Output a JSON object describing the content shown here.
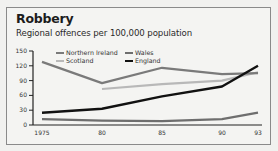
{
  "title": "Robbery",
  "subtitle": "Regional offences per 100,000 population",
  "chart_data": {
    "type": "line",
    "title": "Robbery",
    "subtitle": "Regional offences per 100,000 population",
    "xlabel": "",
    "ylabel": "",
    "x": [
      "1975",
      "80",
      "85",
      "90",
      "93"
    ],
    "x_years": [
      1975,
      1980,
      1985,
      1990,
      1993
    ],
    "yticks": [
      0,
      30,
      60,
      90,
      120,
      150
    ],
    "ylim": [
      0,
      150
    ],
    "grid": false,
    "legend_position": "top inside",
    "series": [
      {
        "name": "Northern Ireland",
        "color": "#7a7a7a",
        "values": [
          128,
          85,
          116,
          103,
          105
        ]
      },
      {
        "name": "Wales",
        "color": "#6e6e6e",
        "values": [
          12,
          9,
          8,
          12,
          25
        ]
      },
      {
        "name": "Scotland",
        "color": "#b8b8b8",
        "values": [
          null,
          73,
          83,
          90,
          107
        ]
      },
      {
        "name": "England",
        "color": "#111111",
        "values": [
          25,
          33,
          58,
          78,
          120
        ]
      }
    ]
  }
}
